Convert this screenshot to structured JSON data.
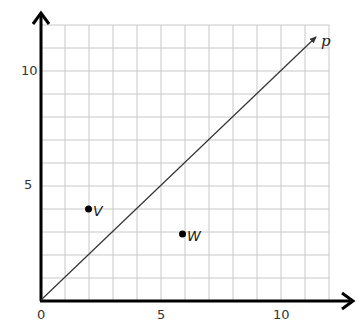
{
  "diagram": {
    "type": "coordinate-plane",
    "grid": {
      "x_min": 0,
      "x_max": 12,
      "y_min": 0,
      "y_max": 12,
      "step": 1
    },
    "x_axis": {
      "ticks": [
        {
          "value": 0,
          "label": "0"
        },
        {
          "value": 5,
          "label": "5"
        },
        {
          "value": 10,
          "label": "10"
        }
      ]
    },
    "y_axis": {
      "ticks": [
        {
          "value": 5,
          "label": "5"
        },
        {
          "value": 10,
          "label": "10"
        }
      ]
    },
    "points": [
      {
        "name": "V",
        "x": 2,
        "y": 4
      },
      {
        "name": "W",
        "x": 6,
        "y": 3
      }
    ],
    "lines": [
      {
        "name": "p",
        "equation": "y = x",
        "from": [
          0,
          0
        ],
        "to": [
          11.5,
          11.5
        ],
        "arrow_end": true
      }
    ],
    "colors": {
      "grid": "#c8c8c8",
      "axis": "#000000",
      "line": "#333333",
      "point": "#000000"
    }
  },
  "labels": {
    "x0": "0",
    "x5": "5",
    "x10": "10",
    "y5": "5",
    "y10": "10",
    "point_v": "V",
    "point_w": "W",
    "line_p": "p"
  }
}
